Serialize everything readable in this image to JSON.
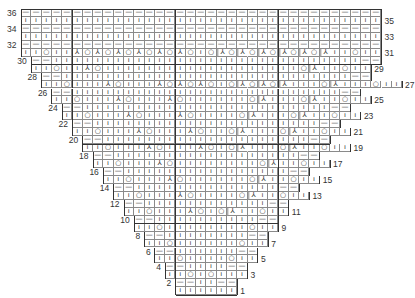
{
  "legend_symbols": {
    "|": "knit-stitch",
    "-": "purl-stitch",
    "O": "yarn-over",
    "L": "ssk-decrease",
    "K": "k2tog-decrease"
  },
  "glyphs": {
    "|": "ı",
    "-": "—",
    "O": "○",
    "L": "⅄",
    "K": "⅄"
  },
  "grid": {
    "columns": 35,
    "rows": 36
  },
  "rows": [
    {
      "n": 1,
      "start": 15,
      "cells": "||||||"
    },
    {
      "n": 2,
      "start": 15,
      "cells": "--||--"
    },
    {
      "n": 3,
      "start": 14,
      "cells": "||O|O|||"
    },
    {
      "n": 4,
      "start": 14,
      "cells": "--||||--"
    },
    {
      "n": 5,
      "start": 13,
      "cells": "||O||||O||"
    },
    {
      "n": 6,
      "start": 13,
      "cells": "--||||||--"
    },
    {
      "n": 7,
      "start": 12,
      "cells": "||O||||||O||"
    },
    {
      "n": 8,
      "start": 12,
      "cells": "--||||||||--"
    },
    {
      "n": 9,
      "start": 11,
      "cells": "||O||||||||O||"
    },
    {
      "n": 10,
      "start": 11,
      "cells": "--||||||||||--"
    },
    {
      "n": 11,
      "start": 10,
      "cells": "||O|||LO|OK||O||"
    },
    {
      "n": 12,
      "start": 10,
      "cells": "--||||||||||||--"
    },
    {
      "n": 13,
      "start": 9,
      "cells": "||O|||LO||||OK||O||"
    },
    {
      "n": 14,
      "start": 9,
      "cells": "--||||||||||||||--"
    },
    {
      "n": 15,
      "start": 8,
      "cells": "||O|||LO||||||OK||O||"
    },
    {
      "n": 16,
      "start": 8,
      "cells": "--||||||||||||||||--"
    },
    {
      "n": 17,
      "start": 7,
      "cells": "||O|||LO||||||||OK||O||"
    },
    {
      "n": 18,
      "start": 7,
      "cells": "--||||||||||||||||||--"
    },
    {
      "n": 19,
      "start": 6,
      "cells": "||O|||LO|||LO|OK|||OK||O||"
    },
    {
      "n": 20,
      "start": 6,
      "cells": "--||||||||||||||||||||--"
    },
    {
      "n": 21,
      "start": 5,
      "cells": "||O|||LO|||LO||OK|||OK||O||"
    },
    {
      "n": 22,
      "start": 5,
      "cells": "--||||||||||||||||||||||--"
    },
    {
      "n": 23,
      "start": 4,
      "cells": "||O|||LO|||LO||||OK|||OK||O||"
    },
    {
      "n": 24,
      "start": 4,
      "cells": "--||||||||||||||||||||||||--"
    },
    {
      "n": 25,
      "start": 3,
      "cells": "||O|||LO|||LO||||||OK|||OK||O||"
    },
    {
      "n": 26,
      "start": 3,
      "cells": "--||||||||||||||||||||||||||--"
    },
    {
      "n": 27,
      "start": 2,
      "cells": "||O|||LO|||LOLOLO|OKOKOK|||OK|||O||"
    },
    {
      "n": 28,
      "start": 2,
      "cells": "--||||||||||||||||||||||||||||--"
    },
    {
      "n": 29,
      "start": 1,
      "cells": "||O||LO|||||||||||||||||||OK||O||"
    },
    {
      "n": 30,
      "start": 1,
      "cells": "--||||||||||||||||||||||||||||||--"
    },
    {
      "n": 31,
      "start": 0,
      "cells": "||O||LOLOLOLOLOLO|OKOKOKOKOKOK||O||"
    },
    {
      "n": 32,
      "start": 0,
      "cells": "-----------------------------------"
    },
    {
      "n": 33,
      "start": 0,
      "cells": "|||||||||||||||||||||||||||||||||||"
    },
    {
      "n": 34,
      "start": 0,
      "cells": "-----------------------------------"
    },
    {
      "n": 35,
      "start": 0,
      "cells": "|||||||||||||||||||||||||||||||||||"
    },
    {
      "n": 36,
      "start": 0,
      "cells": "-----------------------------------"
    }
  ],
  "heavy_columns": [
    5,
    15,
    25
  ],
  "heavy_rows_below": [
    10,
    20,
    30
  ],
  "colors": {
    "grid": "#8a8a8a",
    "outline": "#333333",
    "text": "#333333"
  }
}
